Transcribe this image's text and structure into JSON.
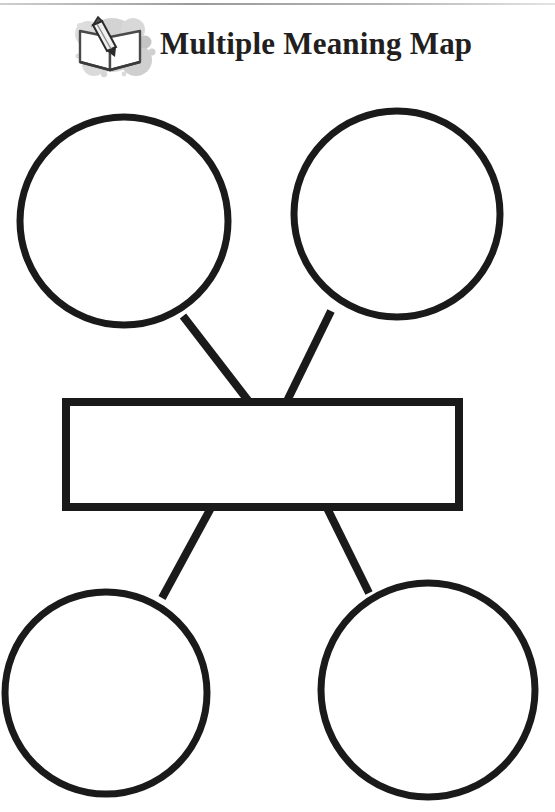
{
  "page": {
    "title": "Multiple Meaning Map",
    "background_color": "#ffffff",
    "stroke_color": "#1a1a1a",
    "logo_gray": "#c9c9c9",
    "rule_color": "#9a9a9a",
    "width": 555,
    "height": 812
  },
  "header": {
    "title": "Multiple Meaning Map",
    "logo_name": "book-with-pencil-logo",
    "logo_alt": "open book with pencil"
  },
  "diagram": {
    "type": "graphic-organizer",
    "center_label": "",
    "center_placeholder": "",
    "nodes": [
      {
        "id": "meaning-top-left",
        "label": "",
        "shape": "circle",
        "cx": 124,
        "cy": 221,
        "r": 105
      },
      {
        "id": "meaning-top-right",
        "label": "",
        "shape": "circle",
        "cx": 397,
        "cy": 214,
        "r": 104
      },
      {
        "id": "word-box",
        "label": "",
        "shape": "rect",
        "x": 63,
        "y": 399,
        "w": 399,
        "h": 111
      },
      {
        "id": "meaning-bottom-left",
        "label": "",
        "shape": "circle",
        "cx": 106,
        "cy": 693,
        "r": 102
      },
      {
        "id": "meaning-bottom-right",
        "label": "",
        "shape": "circle",
        "cx": 428,
        "cy": 690,
        "r": 108
      }
    ],
    "connectors": [
      {
        "id": "connector-top-left",
        "from": "word-box",
        "to": "meaning-top-left",
        "x1": 250,
        "y1": 401,
        "x2": 183,
        "y2": 318
      },
      {
        "id": "connector-top-right",
        "from": "word-box",
        "to": "meaning-top-right",
        "x1": 286,
        "y1": 401,
        "x2": 330,
        "y2": 313
      },
      {
        "id": "connector-bottom-left",
        "from": "word-box",
        "to": "meaning-bottom-left",
        "x1": 211,
        "y1": 508,
        "x2": 163,
        "y2": 597
      },
      {
        "id": "connector-bottom-right",
        "from": "word-box",
        "to": "meaning-bottom-right",
        "x1": 326,
        "y1": 508,
        "x2": 368,
        "y2": 592
      }
    ]
  }
}
